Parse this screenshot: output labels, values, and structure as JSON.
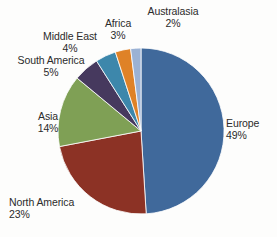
{
  "chart_data": {
    "type": "pie",
    "title": "",
    "xlabel": "",
    "ylabel": "",
    "legend_position": "none",
    "grid": false,
    "labels_outside": true,
    "start_angle_deg": 0,
    "direction": "clockwise",
    "categories": [
      "Europe",
      "North America",
      "Asia",
      "South America",
      "Middle East",
      "Africa",
      "Australasia"
    ],
    "values": [
      49,
      23,
      14,
      5,
      4,
      3,
      2
    ],
    "value_suffix": "%",
    "colors": [
      "#40699B",
      "#8C3225",
      "#7FA055",
      "#46395E",
      "#3D87AB",
      "#DF8227",
      "#9BB2D4"
    ],
    "slices": [
      {
        "label": "Europe",
        "value": 49,
        "value_text": "49%",
        "color": "#40699B"
      },
      {
        "label": "North America",
        "value": 23,
        "value_text": "23%",
        "color": "#8C3225"
      },
      {
        "label": "Asia",
        "value": 14,
        "value_text": "14%",
        "color": "#7FA055"
      },
      {
        "label": "South America",
        "value": 5,
        "value_text": "5%",
        "color": "#46395E"
      },
      {
        "label": "Middle East",
        "value": 4,
        "value_text": "4%",
        "color": "#3D87AB"
      },
      {
        "label": "Africa",
        "value": 3,
        "value_text": "3%",
        "color": "#DF8227"
      },
      {
        "label": "Australasia",
        "value": 2,
        "value_text": "2%",
        "color": "#9BB2D4"
      }
    ]
  },
  "geometry": {
    "center_x": 141,
    "center_y": 131,
    "radius": 83
  },
  "style": {
    "background": "#fdfdfc",
    "text_color": "#2b2b2b",
    "slice_border": "#ffffff"
  }
}
